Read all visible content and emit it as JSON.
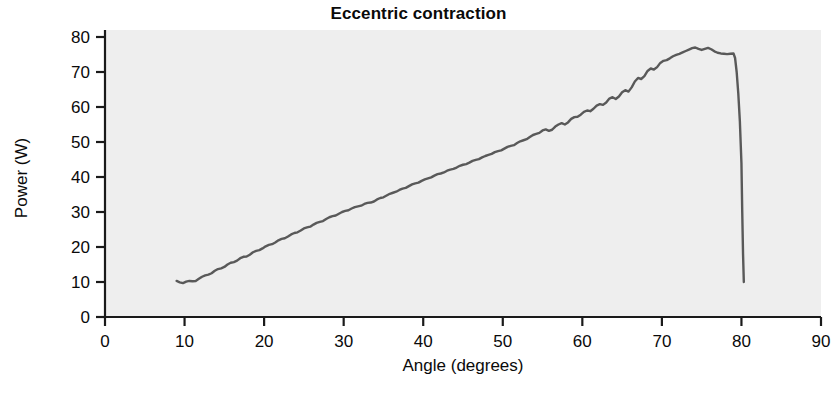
{
  "chart_data": {
    "type": "line",
    "title": "Eccentric contraction",
    "xlabel": "Angle (degrees)",
    "ylabel": "Power (W)",
    "xlim": [
      0,
      90
    ],
    "ylim": [
      0,
      80
    ],
    "xticks": [
      0,
      10,
      20,
      30,
      40,
      50,
      60,
      70,
      80,
      90
    ],
    "yticks": [
      0,
      10,
      20,
      30,
      40,
      50,
      60,
      70,
      80
    ],
    "grid": false,
    "legend": null,
    "plot_background": "#eeeeee",
    "line_color": "#595959",
    "line_width": 2.4,
    "series": [
      {
        "name": "Power",
        "x": [
          9.0,
          9.4,
          9.8,
          10.2,
          10.6,
          11.0,
          11.4,
          11.8,
          12.2,
          12.6,
          13.0,
          13.4,
          13.8,
          14.2,
          14.6,
          15.0,
          15.4,
          15.8,
          16.2,
          16.6,
          17.0,
          17.4,
          17.8,
          18.2,
          18.6,
          19.0,
          19.4,
          19.8,
          20.2,
          20.6,
          21.0,
          21.4,
          21.8,
          22.2,
          22.6,
          23.0,
          23.4,
          23.8,
          24.2,
          24.6,
          25.0,
          25.4,
          25.8,
          26.2,
          26.6,
          27.0,
          27.4,
          27.8,
          28.2,
          28.6,
          29.0,
          29.4,
          29.8,
          30.2,
          30.6,
          31.0,
          31.4,
          31.8,
          32.2,
          32.6,
          33.0,
          33.4,
          33.8,
          34.2,
          34.6,
          35.0,
          35.4,
          35.8,
          36.2,
          36.6,
          37.0,
          37.4,
          37.8,
          38.2,
          38.6,
          39.0,
          39.4,
          39.8,
          40.2,
          40.6,
          41.0,
          41.4,
          41.8,
          42.2,
          42.6,
          43.0,
          43.4,
          43.8,
          44.2,
          44.6,
          45.0,
          45.4,
          45.8,
          46.2,
          46.6,
          47.0,
          47.4,
          47.8,
          48.2,
          48.6,
          49.0,
          49.4,
          49.8,
          50.2,
          50.6,
          51.0,
          51.4,
          51.8,
          52.2,
          52.6,
          53.0,
          53.4,
          53.8,
          54.2,
          54.6,
          55.0,
          55.4,
          55.8,
          56.2,
          56.6,
          57.0,
          57.4,
          57.8,
          58.2,
          58.6,
          59.0,
          59.4,
          59.8,
          60.2,
          60.6,
          61.0,
          61.4,
          61.8,
          62.2,
          62.6,
          63.0,
          63.4,
          63.8,
          64.2,
          64.6,
          65.0,
          65.4,
          65.8,
          66.2,
          66.6,
          67.0,
          67.4,
          67.8,
          68.2,
          68.6,
          69.0,
          69.4,
          69.8,
          70.2,
          70.6,
          71.0,
          71.4,
          71.8,
          72.2,
          72.6,
          73.0,
          73.4,
          73.8,
          74.2,
          74.6,
          75.0,
          75.4,
          75.8,
          76.2,
          76.6,
          77.0,
          77.4,
          77.8,
          78.2,
          78.6,
          79.0,
          79.2,
          79.4,
          79.6,
          79.8,
          80.0,
          80.1,
          80.2,
          80.3
        ],
        "y": [
          10.3,
          9.9,
          9.7,
          10.1,
          10.3,
          10.2,
          10.3,
          10.9,
          11.5,
          11.9,
          12.1,
          12.5,
          13.2,
          13.7,
          13.9,
          14.3,
          15.0,
          15.5,
          15.7,
          16.1,
          16.8,
          17.2,
          17.3,
          17.8,
          18.5,
          18.9,
          19.1,
          19.6,
          20.2,
          20.6,
          20.8,
          21.3,
          21.9,
          22.3,
          22.5,
          23.0,
          23.6,
          24.0,
          24.2,
          24.7,
          25.3,
          25.6,
          25.8,
          26.4,
          26.9,
          27.2,
          27.4,
          28.0,
          28.5,
          28.8,
          29.0,
          29.5,
          30.0,
          30.3,
          30.5,
          31.0,
          31.4,
          31.6,
          31.8,
          32.3,
          32.6,
          32.7,
          33.0,
          33.6,
          34.0,
          34.2,
          34.7,
          35.2,
          35.5,
          35.8,
          36.3,
          36.7,
          36.9,
          37.4,
          37.9,
          38.2,
          38.4,
          38.9,
          39.3,
          39.6,
          39.9,
          40.4,
          40.8,
          41.0,
          41.3,
          41.8,
          42.1,
          42.3,
          42.7,
          43.2,
          43.5,
          43.7,
          44.1,
          44.6,
          44.9,
          45.1,
          45.6,
          46.0,
          46.3,
          46.6,
          47.1,
          47.4,
          47.6,
          48.1,
          48.6,
          48.9,
          49.1,
          49.7,
          50.2,
          50.5,
          50.8,
          51.4,
          52.0,
          52.3,
          52.6,
          53.3,
          53.6,
          53.2,
          53.5,
          54.4,
          55.0,
          55.4,
          55.0,
          55.6,
          56.6,
          57.1,
          57.2,
          57.8,
          58.6,
          59.0,
          58.8,
          59.5,
          60.4,
          60.8,
          60.6,
          61.3,
          62.4,
          62.8,
          62.3,
          63.0,
          64.2,
          64.8,
          64.4,
          65.6,
          67.3,
          68.3,
          68.0,
          68.8,
          70.3,
          71.0,
          70.7,
          71.4,
          72.6,
          73.2,
          73.4,
          73.9,
          74.5,
          74.9,
          75.2,
          75.6,
          76.0,
          76.4,
          76.8,
          77.0,
          76.6,
          76.3,
          76.6,
          76.9,
          76.5,
          75.9,
          75.5,
          75.3,
          75.2,
          75.1,
          75.2,
          75.3,
          74.0,
          70.0,
          64.0,
          56.0,
          44.0,
          30.0,
          18.0,
          10.0
        ]
      }
    ]
  },
  "axes": {
    "x_tick_labels": [
      "0",
      "10",
      "20",
      "30",
      "40",
      "50",
      "60",
      "70",
      "80",
      "90"
    ],
    "y_tick_labels": [
      "0",
      "10",
      "20",
      "30",
      "40",
      "50",
      "60",
      "70",
      "80"
    ]
  }
}
